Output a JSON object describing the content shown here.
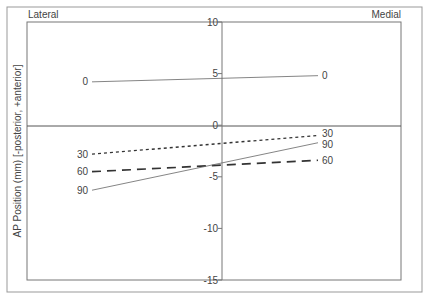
{
  "chart_data": {
    "type": "line",
    "title": "",
    "xlabel": "",
    "ylabel": "AP Position (mm) [-posterior, +anterior]",
    "corner_labels": {
      "left": "Lateral",
      "right": "Medial"
    },
    "x": [
      "Lateral",
      "Medial"
    ],
    "ylim": [
      -15,
      10
    ],
    "yticks": [
      10,
      5,
      0,
      -5,
      -10,
      -15
    ],
    "ytick_labels": [
      "10",
      "5",
      "0",
      "-5",
      "-10",
      "-15"
    ],
    "grid": false,
    "legend": "none (series labeled at line ends)",
    "series": [
      {
        "name": "0",
        "style": "solid-thin",
        "values": [
          4.2,
          4.8
        ]
      },
      {
        "name": "30",
        "style": "short-dash",
        "values": [
          -2.8,
          -1.0
        ]
      },
      {
        "name": "60",
        "style": "long-dash",
        "values": [
          -4.5,
          -3.4
        ]
      },
      {
        "name": "90",
        "style": "solid-thin",
        "values": [
          -6.3,
          -1.7
        ]
      }
    ]
  }
}
